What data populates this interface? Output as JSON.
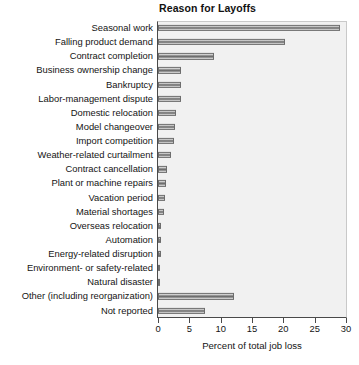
{
  "chart_data": {
    "type": "bar",
    "orientation": "horizontal",
    "title": "Reason for Layoffs",
    "xlabel": "Percent of total job loss",
    "ylabel": "",
    "xlim": [
      0,
      30
    ],
    "xticks": [
      0,
      5,
      10,
      15,
      20,
      25,
      30
    ],
    "xticklabels": [
      "0",
      "5",
      "10",
      "15",
      "20",
      "25",
      "30"
    ],
    "grid": false,
    "legend": null,
    "categories": [
      "Seasonal work",
      "Falling product demand",
      "Contract completion",
      "Business ownership change",
      "Bankruptcy",
      "Labor-management dispute",
      "Domestic relocation",
      "Model changeover",
      "Import competition",
      "Weather-related curtailment",
      "Contract cancellation",
      "Plant or machine repairs",
      "Vacation period",
      "Material shortages",
      "Overseas relocation",
      "Automation",
      "Energy-related disruption",
      "Environment- or safety-related",
      "Natural disaster",
      "Other (including reorganization)",
      "Not reported"
    ],
    "values": [
      29.0,
      20.3,
      8.9,
      3.7,
      3.6,
      3.6,
      2.9,
      2.7,
      2.6,
      2.1,
      1.4,
      1.2,
      1.1,
      1.0,
      0.5,
      0.4,
      0.4,
      0.3,
      0.2,
      12.2,
      7.5
    ],
    "colors": {
      "bar_fill": "#8d8d8d",
      "bar_edge": "#6d6d6d",
      "plot_background": "#f1f1f1",
      "axis": "#4a4a4a",
      "text": "#141414"
    }
  }
}
